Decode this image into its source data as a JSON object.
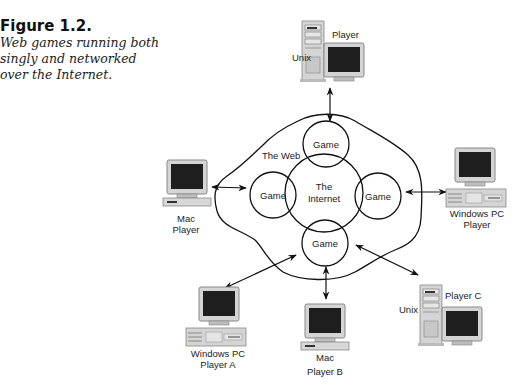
{
  "figure": {
    "number": "Figure 1.2.",
    "caption_lines": [
      "Web games running both",
      "singly and networked",
      "over the Internet."
    ]
  },
  "diagram": {
    "web_label": "The Web",
    "internet_label_lines": [
      "The",
      "Internet"
    ],
    "game_label": "Game",
    "game_nodes": [
      "top",
      "left",
      "right",
      "bottom"
    ],
    "nodes": {
      "unix_top": {
        "os": "Unix",
        "label": "Player"
      },
      "mac_left": {
        "lines": [
          "Mac",
          "Player"
        ]
      },
      "windows_right": {
        "lines": [
          "Windows PC",
          "Player"
        ]
      },
      "windows_a": {
        "lines": [
          "Windows PC",
          "Player A"
        ]
      },
      "mac_b": {
        "lines": [
          "Mac",
          "Player B"
        ]
      },
      "unix_c": {
        "os": "Unix",
        "label": "Player C"
      }
    },
    "colors": {
      "line": "#111111",
      "screen": "#1e1e1e",
      "case": "#d8d8d8",
      "case_dark": "#a8a8a8"
    }
  }
}
